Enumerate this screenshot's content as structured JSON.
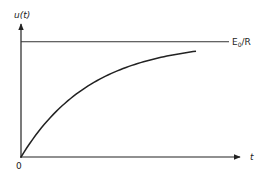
{
  "chart_data": {
    "type": "line",
    "title": "",
    "xlabel": "t",
    "ylabel": "u(t)",
    "origin_label": "0",
    "xlim": [
      0,
      3.2
    ],
    "ylim": [
      0,
      1.18
    ],
    "grid": false,
    "legend": "none",
    "asymptote": {
      "y": 1.0,
      "label_main": "E",
      "label_sub": "0",
      "label_rest": "/R"
    },
    "series": [
      {
        "name": "u(t) = (E0/R)(1 - e^(-t/τ))",
        "x": [
          0,
          0.25,
          0.5,
          0.75,
          1.0,
          1.25,
          1.5,
          1.75,
          2.0,
          2.25,
          2.5
        ],
        "y": [
          0,
          0.221,
          0.393,
          0.528,
          0.632,
          0.713,
          0.777,
          0.826,
          0.865,
          0.895,
          0.918
        ]
      }
    ]
  }
}
